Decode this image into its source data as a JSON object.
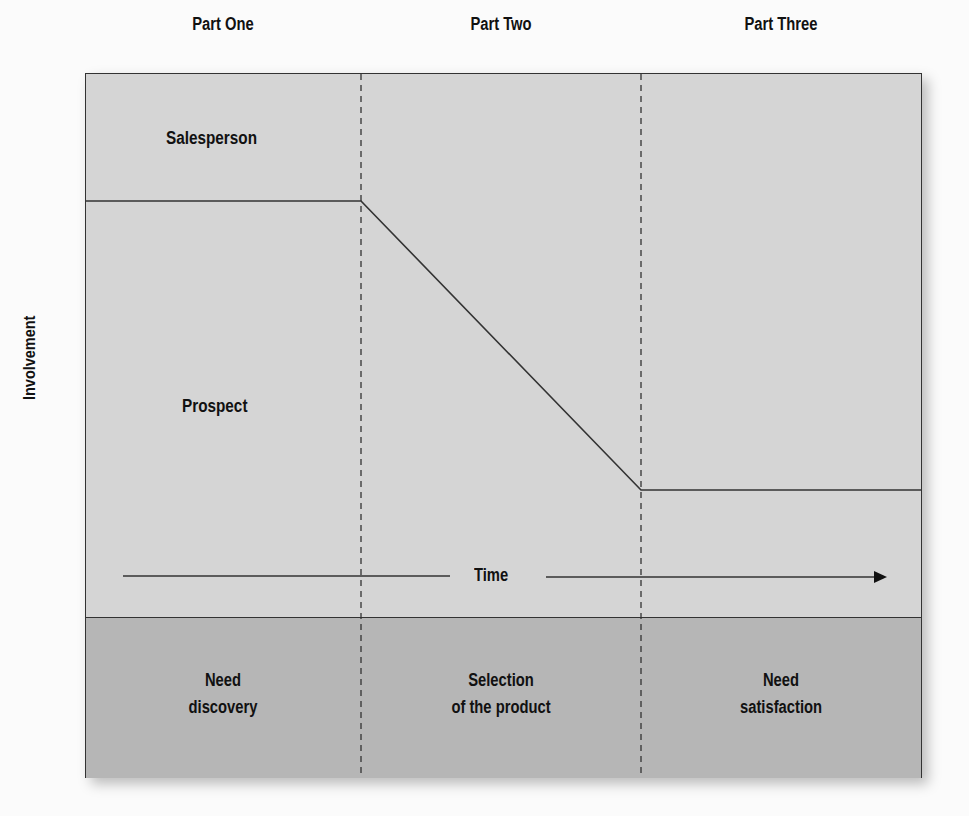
{
  "parts": [
    {
      "label": "Part One"
    },
    {
      "label": "Part Two"
    },
    {
      "label": "Part Three"
    }
  ],
  "axes": {
    "y_label": "Involvement",
    "x_label": "Time"
  },
  "regions": {
    "salesperson": "Salesperson",
    "prospect": "Prospect"
  },
  "stages": [
    {
      "line1": "Need",
      "line2": "discovery"
    },
    {
      "line1": "Selection",
      "line2": "of the product"
    },
    {
      "line1": "Need",
      "line2": "satisfaction"
    }
  ],
  "colors": {
    "upper_fill": "#d5d5d5",
    "lower_fill": "#b6b6b6",
    "line": "#333333"
  }
}
